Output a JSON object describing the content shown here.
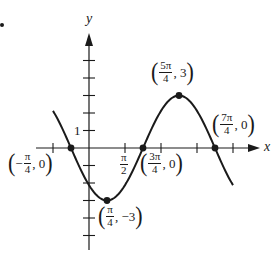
{
  "chart_data": {
    "type": "line",
    "title": "",
    "function": "y = 3 sin(x - 3π/4)",
    "xlabel": "x",
    "ylabel": "y",
    "x_unit": "π/4",
    "xlim": [
      -0.5,
      2.0
    ],
    "xlim_note": "in units of π",
    "ylim": [
      -7,
      6
    ],
    "x_ticks_pi_multiples": [
      -0.5,
      0.5,
      1.0,
      1.5,
      2.0
    ],
    "x_tick_labels": {
      "0.5": "π/2"
    },
    "y_ticks": [
      -5,
      -4,
      -3,
      -2,
      -1,
      1,
      2,
      3,
      4,
      5
    ],
    "y_tick_labels": {
      "1": "1"
    },
    "grid": false,
    "series": [
      {
        "name": "curve",
        "x_pi": [
          -0.5,
          -0.25,
          0.25,
          0.75,
          1.25,
          1.75,
          2.0
        ],
        "y": [
          2.12,
          0,
          -3,
          0,
          3,
          0,
          -2.12
        ]
      }
    ],
    "points": [
      {
        "x_pi": -0.25,
        "y": 0,
        "label_num": "π",
        "label_den": "4",
        "label_sign": "−",
        "label_y": "0"
      },
      {
        "x_pi": 0.25,
        "y": -3,
        "label_num": "π",
        "label_den": "4",
        "label_sign": "",
        "label_y": "−3"
      },
      {
        "x_pi": 0.75,
        "y": 0,
        "label_num": "3π",
        "label_den": "4",
        "label_sign": "",
        "label_y": "0"
      },
      {
        "x_pi": 1.25,
        "y": 3,
        "label_num": "5π",
        "label_den": "4",
        "label_sign": "",
        "label_y": "3"
      },
      {
        "x_pi": 1.75,
        "y": 0,
        "label_num": "7π",
        "label_den": "4",
        "label_sign": "",
        "label_y": "0"
      }
    ]
  },
  "labels": {
    "x_axis": "x",
    "y_axis": "y",
    "y_tick_one": "1",
    "x_tick_pi2_num": "π",
    "x_tick_pi2_den": "2",
    "open": "(",
    "close": ")",
    "comma": ",",
    "p_neg_pi4": {
      "sign": "−",
      "num": "π",
      "den": "4",
      "y": "0"
    },
    "p_pi4": {
      "num": "π",
      "den": "4",
      "y": "−3"
    },
    "p_3pi4": {
      "num": "3π",
      "den": "4",
      "y": "0"
    },
    "p_5pi4": {
      "num": "5π",
      "den": "4",
      "y": "3"
    },
    "p_7pi4": {
      "num": "7π",
      "den": "4",
      "y": "0"
    }
  },
  "style": {
    "ink": "#1a1a1a",
    "background": "#ffffff"
  }
}
